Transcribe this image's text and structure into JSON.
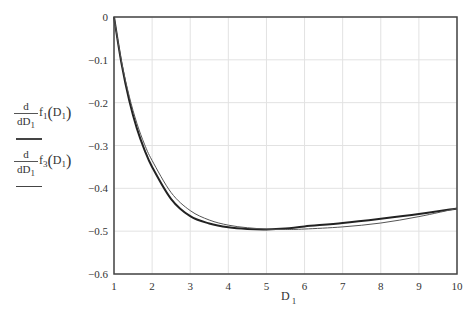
{
  "chart_data": {
    "type": "line",
    "title": "",
    "xlabel": "D",
    "xlabel_sub": "1",
    "ylabel": "d/dD1 f1(D1), d/dD1 f3(D1)",
    "xlim": [
      1,
      10
    ],
    "ylim": [
      -0.6,
      0
    ],
    "grid": true,
    "legend_position": "left (y-axis label stack)",
    "x_ticks": [
      "1",
      "2",
      "3",
      "4",
      "5",
      "6",
      "7",
      "8",
      "9",
      "10"
    ],
    "y_ticks": [
      "0",
      "-0.1",
      "-0.2",
      "-0.3",
      "-0.4",
      "-0.5",
      "-0.6"
    ],
    "x": [
      1,
      1.2,
      1.4,
      1.6,
      1.8,
      2,
      2.5,
      3,
      3.5,
      4,
      4.5,
      5,
      5.5,
      6,
      7,
      8,
      9,
      10
    ],
    "series": [
      {
        "name": "d/dD1 f1(D1)",
        "style": "thick dark",
        "values": [
          0,
          -0.11,
          -0.195,
          -0.26,
          -0.31,
          -0.35,
          -0.425,
          -0.465,
          -0.482,
          -0.491,
          -0.495,
          -0.496,
          -0.494,
          -0.489,
          -0.481,
          -0.471,
          -0.46,
          -0.447
        ]
      },
      {
        "name": "d/dD1 f3(D1)",
        "style": "thin",
        "values": [
          0,
          -0.105,
          -0.185,
          -0.248,
          -0.297,
          -0.335,
          -0.41,
          -0.452,
          -0.474,
          -0.486,
          -0.492,
          -0.495,
          -0.496,
          -0.495,
          -0.49,
          -0.481,
          -0.466,
          -0.447
        ]
      }
    ]
  },
  "legend": {
    "entries": [
      {
        "d": "d",
        "dD": "dD",
        "sub": "1",
        "fn": "f",
        "fn_sub": "1",
        "arg": "D",
        "arg_sub": "1"
      },
      {
        "d": "d",
        "dD": "dD",
        "sub": "1",
        "fn": "f",
        "fn_sub": "3",
        "arg": "D",
        "arg_sub": "1"
      }
    ]
  },
  "axis": {
    "x_label": "D",
    "x_label_sub": "1"
  }
}
